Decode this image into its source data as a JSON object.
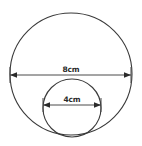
{
  "figure": {
    "background_color": "#ffffff",
    "stroke_color": "#3a3a3a",
    "dimension_color": "#2b2b2b",
    "label_color": "#2b2b2b"
  },
  "shapes": {
    "outer_circle": {
      "name": "large-circle",
      "center_x": 71,
      "center_y": 74,
      "radius": 61,
      "diameter_label": "8cm",
      "diameter_value": 8,
      "units": "cm"
    },
    "inner_circle": {
      "name": "small-circle",
      "center_x": 72,
      "center_y": 108,
      "radius": 29,
      "diameter_label": "4cm",
      "diameter_value": 4,
      "units": "cm"
    }
  },
  "dimensions": [
    {
      "name": "outer-diameter-dimension",
      "label": "8cm",
      "x_start": 10,
      "x_end": 131,
      "y": 75,
      "label_x": 71,
      "label_y": 72
    },
    {
      "name": "inner-diameter-dimension",
      "label": "4cm",
      "x_start": 43,
      "x_end": 101,
      "y": 105,
      "label_x": 72,
      "label_y": 102
    }
  ],
  "chart_data": {
    "type": "diagram",
    "xlabel": "",
    "ylabel": "",
    "categories": [
      "Large circle",
      "Small circle"
    ],
    "values": [
      8,
      4
    ],
    "series": [
      {
        "name": "Diameter (cm)",
        "values": [
          8,
          4
        ]
      }
    ],
    "annotations": [
      "8cm",
      "4cm"
    ],
    "legend": []
  }
}
